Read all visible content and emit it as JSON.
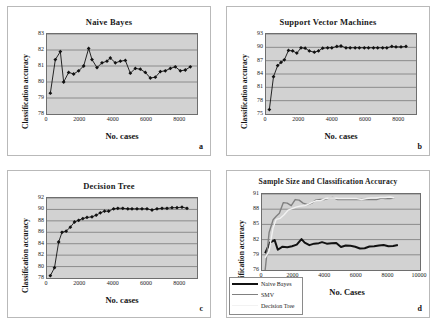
{
  "figure": {
    "background": "#ffffff",
    "plot_background": "#d2d2d2",
    "gridline_color": "#7a7a7a",
    "series_colors": {
      "naive_bayes": "#111111",
      "svm": "#808080",
      "decision_tree": "#f2f2f2"
    }
  },
  "panels": {
    "a": {
      "letter": "a",
      "title": "Naive Bayes",
      "xlabel": "No. cases",
      "ylabel": "Classification accuracy"
    },
    "b": {
      "letter": "b",
      "title": "Support Vector Machines",
      "xlabel": "No. cases",
      "ylabel": "Classification accuracy"
    },
    "c": {
      "letter": "c",
      "title": "Decision Tree",
      "xlabel": "No. cases",
      "ylabel": "Classification accuracy"
    },
    "d": {
      "letter": "d",
      "title": "Sample Size and Classification Accuracy",
      "xlabel": "No. Cases",
      "ylabel": "Classification accuracy"
    }
  },
  "legend": {
    "items": [
      {
        "label": "Naive Bayes",
        "color": "#111111",
        "width": 2.4
      },
      {
        "label": "SMV",
        "color": "#808080",
        "width": 1.6
      },
      {
        "label": "Decision Tree",
        "color": "#f2f2f2",
        "width": 1.6
      }
    ]
  },
  "chart_data": [
    {
      "id": "a",
      "type": "line",
      "title": "Naive Bayes",
      "xlabel": "No. cases",
      "ylabel": "Classification accuracy",
      "xlim": [
        0,
        9000
      ],
      "ylim": [
        78,
        83
      ],
      "xticks": [
        0,
        2000,
        4000,
        6000,
        8000
      ],
      "yticks": [
        78,
        79,
        80,
        81,
        82,
        83
      ],
      "grid": "horizontal",
      "markers": "diamond",
      "series": [
        {
          "name": "Naive Bayes",
          "color": "#111111",
          "x": [
            200,
            500,
            800,
            1000,
            1300,
            1600,
            1900,
            2200,
            2500,
            2700,
            3000,
            3300,
            3600,
            3800,
            4100,
            4400,
            4700,
            5000,
            5300,
            5600,
            5900,
            6200,
            6500,
            6800,
            7100,
            7400,
            7700,
            8000,
            8300,
            8600
          ],
          "y": [
            79.3,
            81.4,
            81.9,
            80.0,
            80.6,
            80.5,
            80.7,
            81.0,
            82.1,
            81.4,
            80.9,
            81.2,
            81.3,
            81.5,
            81.2,
            81.3,
            81.35,
            80.55,
            80.85,
            80.8,
            80.6,
            80.25,
            80.3,
            80.65,
            80.7,
            80.85,
            80.95,
            80.7,
            80.75,
            80.95
          ]
        }
      ]
    },
    {
      "id": "b",
      "type": "line",
      "title": "Support Vector Machines",
      "xlabel": "No. cases",
      "ylabel": "Classification accuracy",
      "xlim": [
        0,
        9000
      ],
      "ylim": [
        75,
        93
      ],
      "xticks": [
        0,
        2000,
        4000,
        6000,
        8000
      ],
      "yticks": [
        75,
        78,
        81,
        84,
        87,
        90,
        93
      ],
      "grid": "horizontal",
      "markers": "diamond",
      "series": [
        {
          "name": "Support Vector Machines",
          "color": "#111111",
          "x": [
            200,
            450,
            700,
            900,
            1100,
            1350,
            1600,
            1850,
            2100,
            2350,
            2600,
            2900,
            3150,
            3400,
            3700,
            3950,
            4250,
            4500,
            4800,
            5050,
            5350,
            5600,
            5900,
            6150,
            6450,
            6700,
            7000,
            7250,
            7550,
            7800,
            8100,
            8400
          ],
          "y": [
            76.0,
            83.4,
            85.9,
            86.6,
            87.2,
            89.3,
            89.2,
            88.7,
            89.9,
            89.8,
            89.2,
            88.9,
            89.2,
            89.8,
            89.9,
            89.9,
            90.2,
            90.3,
            89.9,
            89.9,
            89.9,
            89.9,
            89.9,
            89.9,
            89.9,
            89.9,
            89.9,
            89.9,
            90.2,
            90.1,
            90.1,
            90.2
          ]
        }
      ]
    },
    {
      "id": "c",
      "type": "line",
      "title": "Decision Tree",
      "xlabel": "No. cases",
      "ylabel": "Classification accuracy",
      "xlim": [
        0,
        9000
      ],
      "ylim": [
        78,
        92
      ],
      "xticks": [
        0,
        2000,
        4000,
        6000,
        8000
      ],
      "yticks": [
        78,
        80,
        82,
        84,
        86,
        88,
        90,
        92
      ],
      "grid": "horizontal",
      "markers": "diamond",
      "series": [
        {
          "name": "Decision Tree",
          "color": "#111111",
          "x": [
            200,
            450,
            700,
            900,
            1150,
            1400,
            1650,
            1900,
            2150,
            2400,
            2700,
            2950,
            3200,
            3450,
            3700,
            4000,
            4250,
            4550,
            4850,
            5100,
            5400,
            5700,
            6000,
            6300,
            6600,
            6900,
            7200,
            7500,
            7800,
            8100,
            8400
          ],
          "y": [
            78.4,
            79.8,
            84.3,
            86.0,
            86.2,
            86.9,
            87.8,
            88.1,
            88.4,
            88.6,
            88.7,
            89.0,
            89.4,
            89.7,
            89.7,
            90.1,
            90.2,
            90.2,
            90.1,
            90.1,
            90.1,
            90.1,
            90.1,
            89.9,
            90.1,
            90.2,
            90.2,
            90.3,
            90.3,
            90.4,
            90.2
          ]
        }
      ]
    },
    {
      "id": "d",
      "type": "line",
      "title": "Sample Size and Classification Accuracy",
      "xlabel": "No. Cases",
      "ylabel": "Classification accuracy",
      "xlim": [
        0,
        10000
      ],
      "ylim": [
        76,
        91
      ],
      "xticks": [
        0,
        2000,
        4000,
        6000,
        8000,
        10000
      ],
      "yticks": [
        76,
        79,
        82,
        85,
        88,
        91
      ],
      "grid": "horizontal",
      "markers": "none",
      "series": [
        {
          "name": "Naive Bayes",
          "color": "#111111",
          "x": [
            200,
            500,
            800,
            1000,
            1300,
            1600,
            1900,
            2200,
            2500,
            2700,
            3000,
            3300,
            3600,
            3800,
            4100,
            4400,
            4700,
            5000,
            5300,
            5600,
            5900,
            6200,
            6500,
            6800,
            7100,
            7400,
            7700,
            8000,
            8300,
            8600
          ],
          "y": [
            79.3,
            81.4,
            81.9,
            80.0,
            80.6,
            80.5,
            80.7,
            81.0,
            82.1,
            81.4,
            80.9,
            81.2,
            81.3,
            81.5,
            81.2,
            81.3,
            81.35,
            80.55,
            80.85,
            80.8,
            80.6,
            80.25,
            80.3,
            80.65,
            80.7,
            80.85,
            80.95,
            80.7,
            80.75,
            80.95
          ]
        },
        {
          "name": "SMV",
          "color": "#808080",
          "x": [
            200,
            450,
            700,
            900,
            1100,
            1350,
            1600,
            1850,
            2100,
            2350,
            2600,
            2900,
            3150,
            3400,
            3700,
            3950,
            4250,
            4500,
            4800,
            5050,
            5350,
            5600,
            5900,
            6150,
            6450,
            6700,
            7000,
            7250,
            7550,
            7800,
            8100,
            8400
          ],
          "y": [
            76.0,
            83.4,
            85.9,
            86.6,
            87.2,
            89.3,
            89.2,
            88.7,
            89.9,
            89.8,
            89.2,
            88.9,
            89.2,
            89.8,
            89.9,
            89.9,
            90.2,
            90.3,
            89.9,
            89.9,
            89.9,
            89.9,
            89.9,
            89.9,
            89.9,
            89.9,
            89.9,
            89.9,
            90.2,
            90.1,
            90.1,
            90.2
          ]
        },
        {
          "name": "Decision Tree",
          "color": "#f2f2f2",
          "x": [
            200,
            450,
            700,
            900,
            1150,
            1400,
            1650,
            1900,
            2150,
            2400,
            2700,
            2950,
            3200,
            3450,
            3700,
            4000,
            4250,
            4550,
            4850,
            5100,
            5400,
            5700,
            6000,
            6300,
            6600,
            6900,
            7200,
            7500,
            7800,
            8100,
            8400
          ],
          "y": [
            78.4,
            79.8,
            84.3,
            86.0,
            86.2,
            86.9,
            87.8,
            88.1,
            88.4,
            88.6,
            88.7,
            89.0,
            89.4,
            89.7,
            89.7,
            90.1,
            90.2,
            90.2,
            90.1,
            90.1,
            90.1,
            90.1,
            90.1,
            89.9,
            90.1,
            90.2,
            90.2,
            90.3,
            90.3,
            90.4,
            90.2
          ]
        }
      ]
    }
  ]
}
